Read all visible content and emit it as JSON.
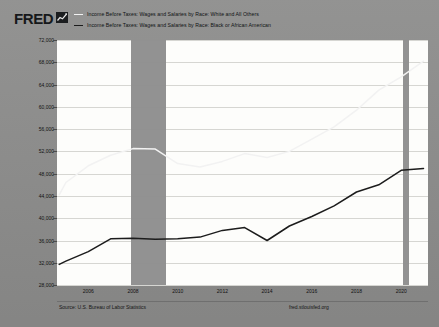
{
  "header": {
    "logo_text": "FRED",
    "logo_icon": "fred-chart-glyph-icon",
    "legend": [
      {
        "label": "Income Before Taxes: Wages and Salaries by Race: White and All Others",
        "color": "#f2f2f2",
        "style": "light"
      },
      {
        "label": "Income Before Taxes: Wages and Salaries by Race: Black or African American",
        "color": "#1c1c1c",
        "style": "dark"
      }
    ]
  },
  "footer": {
    "source": "Source: U.S. Bureau of Labor Statistics",
    "url": "fred.stlouisfed.org"
  },
  "chart_data": {
    "type": "line",
    "title": "",
    "xlabel": "",
    "ylabel": "U.S. Dollars",
    "xlim": [
      2004.6,
      2021.2
    ],
    "ylim": [
      28000,
      72000
    ],
    "grid": true,
    "legend_position": "top",
    "yticks": [
      72000,
      68000,
      64000,
      60000,
      56000,
      52000,
      48000,
      44000,
      40000,
      36000,
      32000,
      28000
    ],
    "ytick_labels": [
      "72,000",
      "68,000",
      "64,000",
      "60,000",
      "56,000",
      "52,000",
      "48,000",
      "44,000",
      "40,000",
      "36,000",
      "32,000",
      "28,000"
    ],
    "xticks": [
      2006,
      2008,
      2010,
      2012,
      2014,
      2016,
      2018,
      2020
    ],
    "xtick_labels": [
      "2006",
      "2008",
      "2010",
      "2012",
      "2014",
      "2016",
      "2018",
      "2020"
    ],
    "recessions": [
      {
        "start": 2007.92,
        "end": 2009.5
      },
      {
        "start": 2020.1,
        "end": 2020.35
      }
    ],
    "series": [
      {
        "name": "Income Before Taxes: Wages and Salaries by Race: White and All Others",
        "color": "#f2f2f2",
        "x": [
          2004.7,
          2005,
          2006,
          2007,
          2008,
          2009,
          2010,
          2011,
          2012,
          2013,
          2014,
          2015,
          2016,
          2017,
          2018,
          2019,
          2020,
          2021
        ],
        "values": [
          44200,
          46400,
          49400,
          51300,
          52500,
          52400,
          49800,
          49200,
          50200,
          51600,
          50900,
          52000,
          54200,
          56400,
          59400,
          63000,
          65400,
          68200
        ]
      },
      {
        "name": "Income Before Taxes: Wages and Salaries by Race: Black or African American",
        "color": "#1c1c1c",
        "x": [
          2004.7,
          2005,
          2006,
          2007,
          2008,
          2009,
          2010,
          2011,
          2012,
          2013,
          2014,
          2015,
          2016,
          2017,
          2018,
          2019,
          2020,
          2021
        ],
        "values": [
          31700,
          32300,
          34000,
          36300,
          36400,
          36200,
          36300,
          36600,
          37800,
          38300,
          36000,
          38600,
          40300,
          42200,
          44700,
          46000,
          48600,
          48900
        ]
      }
    ]
  }
}
